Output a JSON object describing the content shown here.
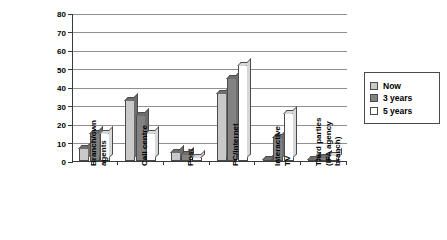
{
  "chart_data": {
    "type": "bar",
    "title": "",
    "xlabel": "",
    "ylabel": "Percentage of\ncustomers",
    "ylim": [
      0,
      80
    ],
    "ytick_step": 10,
    "yticks": [
      "0",
      "10",
      "20",
      "30",
      "40",
      "50",
      "60",
      "70",
      "80"
    ],
    "grid": true,
    "legend_position": "right",
    "categories": [
      "Branch/own\nagents",
      "Call centre",
      "Post",
      "PC/Internet",
      "Interactive\nTV",
      "Third parties\n(IFA agency\nbranch)"
    ],
    "series": [
      {
        "name": "Now",
        "color": "#c9c9c9",
        "values": [
          7,
          33,
          5,
          37,
          0,
          1
        ]
      },
      {
        "name": "3 years",
        "color": "#828282",
        "values": [
          15,
          25,
          4,
          45,
          13,
          2
        ]
      },
      {
        "name": "5 years",
        "color": "#ffffff",
        "values": [
          15,
          15,
          2,
          52,
          26,
          3
        ]
      }
    ]
  },
  "legend": {
    "items": [
      {
        "label": "Now",
        "color": "#c9c9c9"
      },
      {
        "label": "3 years",
        "color": "#828282"
      },
      {
        "label": "5 years",
        "color": "#ffffff"
      }
    ]
  },
  "axis": {
    "y_title": "Percentage of\ncustomers"
  }
}
